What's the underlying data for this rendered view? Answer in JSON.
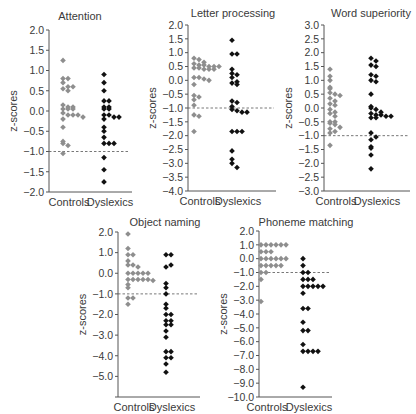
{
  "colors": {
    "controls": "#8e8e8e",
    "dyslexics": "#111111",
    "axis": "#555555",
    "text": "#3a3a3a",
    "threshold": "#555555"
  },
  "chart_data": [
    {
      "type": "scatter",
      "title": "Attention",
      "xlabel": "",
      "ylabel": "z-scores",
      "categories": [
        "Controls",
        "Dyslexics"
      ],
      "ylim": [
        -2.0,
        2.0
      ],
      "ytick_step": 0.5,
      "yticks": [
        "2.0",
        "1.5",
        "1.0",
        "0.5",
        "0.0",
        "−0.5",
        "−1.0",
        "−1.5",
        "−2.0"
      ],
      "threshold": -1.0,
      "grid": false,
      "layout": {
        "axis_x": 49,
        "top_y": 30,
        "bottom_y": 192,
        "right_x": 132,
        "cx": [
          69,
          110
        ],
        "title_x": 80,
        "title_y": 20
      },
      "series": [
        {
          "name": "Controls",
          "values": [
            1.25,
            0.8,
            0.8,
            0.7,
            0.6,
            0.6,
            0.55,
            0.5,
            0.15,
            0.1,
            0.1,
            0.05,
            0.05,
            0.05,
            -0.05,
            -0.1,
            -0.1,
            -0.1,
            -0.15,
            -0.2,
            -0.4,
            -0.75,
            -0.8,
            -0.85,
            -1.05
          ]
        },
        {
          "name": "Dyslexics",
          "values": [
            0.9,
            0.7,
            0.5,
            0.25,
            0.25,
            0.1,
            0.1,
            0.05,
            0.05,
            -0.1,
            -0.1,
            -0.15,
            -0.15,
            -0.2,
            -0.4,
            -0.5,
            -0.65,
            -0.8,
            -0.8,
            -0.8,
            -1.15,
            -1.45,
            -1.75
          ]
        }
      ]
    },
    {
      "type": "scatter",
      "title": "Letter processing",
      "xlabel": "",
      "ylabel": "z-scores",
      "categories": [
        "Controls",
        "Dyslexics"
      ],
      "ylim": [
        -4.0,
        2.0
      ],
      "ytick_step": 0.5,
      "yticks": [
        "2.0",
        "1.5",
        "1.0",
        "0.5",
        "0.0",
        "−0.5",
        "−1.0",
        "−1.5",
        "−2.0",
        "−2.5",
        "−3.0",
        "−3.5",
        "−4.0"
      ],
      "threshold": -1.0,
      "grid": false,
      "layout": {
        "axis_x": 188,
        "top_y": 25,
        "bottom_y": 191,
        "right_x": 276,
        "cx": [
          200,
          238
        ],
        "title_x": 233,
        "title_y": 17
      },
      "series": [
        {
          "name": "Controls",
          "values": [
            0.8,
            0.75,
            0.65,
            0.6,
            0.55,
            0.55,
            0.5,
            0.5,
            0.5,
            0.45,
            0.45,
            0.4,
            0.4,
            0.4,
            0.1,
            0.1,
            0.05,
            0.0,
            -0.15,
            -0.55,
            -0.6,
            -0.7,
            -0.9,
            -1.25,
            -1.3,
            -1.85
          ]
        },
        {
          "name": "Dyslexics",
          "values": [
            1.45,
            0.95,
            0.95,
            0.4,
            0.25,
            0.2,
            0.1,
            -0.05,
            -0.1,
            -0.15,
            -0.75,
            -0.8,
            -0.95,
            -1.05,
            -1.1,
            -1.15,
            -1.15,
            -1.85,
            -1.85,
            -1.85,
            -2.55,
            -2.85,
            -3.0,
            -3.15
          ]
        }
      ]
    },
    {
      "type": "scatter",
      "title": "Word superiority",
      "xlabel": "",
      "ylabel": "z-scores",
      "categories": [
        "Controls",
        "Dyslexics"
      ],
      "ylim": [
        -3.0,
        3.0
      ],
      "ytick_step": 0.5,
      "yticks": [
        "3.0",
        "2.5",
        "2.0",
        "1.5",
        "1.0",
        "0.5",
        "0.0",
        "−0.5",
        "−1.0",
        "−1.5",
        "−2.0",
        "−2.5",
        "−3.0"
      ],
      "threshold": -1.0,
      "grid": false,
      "layout": {
        "axis_x": 324,
        "top_y": 25,
        "bottom_y": 191,
        "right_x": 410,
        "cx": [
          336,
          377
        ],
        "title_x": 371,
        "title_y": 17
      },
      "series": [
        {
          "name": "Controls",
          "values": [
            1.4,
            1.15,
            1.0,
            0.75,
            0.7,
            0.55,
            0.5,
            0.45,
            0.35,
            0.25,
            0.15,
            0.1,
            -0.05,
            -0.15,
            -0.2,
            -0.3,
            -0.5,
            -0.5,
            -0.55,
            -0.6,
            -0.7,
            -0.75,
            -0.85,
            -0.9,
            -1.35
          ]
        },
        {
          "name": "Dyslexics",
          "values": [
            1.8,
            1.7,
            1.55,
            1.5,
            1.2,
            1.15,
            1.0,
            0.95,
            0.5,
            0.05,
            0.0,
            -0.05,
            -0.15,
            -0.2,
            -0.25,
            -0.25,
            -0.3,
            -0.3,
            -0.35,
            -0.35,
            -0.9,
            -1.05,
            -1.15,
            -1.4,
            -1.45,
            -1.7,
            -2.2
          ]
        }
      ]
    },
    {
      "type": "scatter",
      "title": "Object naming",
      "xlabel": "",
      "ylabel": "z-scores",
      "categories": [
        "Controls",
        "Dyslexics"
      ],
      "ylim": [
        -6.0,
        2.0
      ],
      "ytick_step": 1.0,
      "yticks": [
        "2.0",
        "1.0",
        "0.0",
        "−1.0",
        "−2.0",
        "−3.0",
        "−4.0",
        "−5.0",
        ""
      ],
      "threshold": -1.0,
      "grid": false,
      "layout": {
        "axis_x": 118,
        "top_y": 232,
        "bottom_y": 397,
        "right_x": 200,
        "cx": [
          134,
          172
        ],
        "title_x": 165,
        "title_y": 226
      },
      "series": [
        {
          "name": "Controls",
          "values": [
            1.9,
            1.2,
            0.9,
            0.9,
            0.6,
            0.4,
            0.4,
            0.3,
            0.0,
            0.0,
            0.0,
            0.0,
            0.0,
            -0.3,
            -0.3,
            -0.3,
            -0.3,
            -0.3,
            -0.35,
            -0.55,
            -0.7,
            -1.2,
            -1.2,
            -1.5
          ]
        },
        {
          "name": "Dyslexics",
          "values": [
            0.9,
            0.9,
            0.3,
            0.4,
            -0.5,
            -0.7,
            -1.0,
            -1.5,
            -1.7,
            -2.0,
            -2.0,
            -2.3,
            -2.3,
            -2.5,
            -2.5,
            -2.8,
            -3.1,
            -3.8,
            -3.8,
            -4.1,
            -4.1,
            -4.4,
            -4.8
          ]
        }
      ]
    },
    {
      "type": "scatter",
      "title": "Phoneme matching",
      "xlabel": "",
      "ylabel": "z-scores",
      "categories": [
        "Controls",
        "Dyslexics"
      ],
      "ylim": [
        -10.0,
        2.0
      ],
      "ytick_step": 1.0,
      "yticks": [
        "2.0",
        "1.0",
        "0.0",
        "−1.0",
        "−2.0",
        "−3.0",
        "−4.0",
        "−5.0",
        "−6.0",
        "−7.0",
        "−8.0",
        "−9.0",
        "−10.0"
      ],
      "threshold": -1.0,
      "grid": false,
      "layout": {
        "axis_x": 259,
        "top_y": 231,
        "bottom_y": 397,
        "right_x": 332,
        "cx": [
          267,
          309
        ],
        "title_x": 306,
        "title_y": 226
      },
      "series": [
        {
          "name": "Controls",
          "values": [
            1.0,
            1.0,
            1.0,
            1.0,
            1.0,
            1.0,
            0.5,
            0.5,
            0.5,
            0.0,
            0.0,
            0.0,
            0.0,
            0.0,
            0.0,
            -0.5,
            -0.5,
            -0.5,
            -0.5,
            -0.5,
            -1.0,
            -1.0,
            -1.5,
            -3.1
          ]
        },
        {
          "name": "Dyslexics",
          "values": [
            0.0,
            -0.5,
            -1.0,
            -1.0,
            -1.5,
            -1.5,
            -1.5,
            -2.0,
            -2.0,
            -2.0,
            -2.0,
            -2.0,
            -2.5,
            -3.6,
            -3.6,
            -4.6,
            -5.2,
            -5.2,
            -6.2,
            -6.7,
            -6.7,
            -6.7,
            -6.7,
            -9.3
          ]
        }
      ]
    }
  ]
}
